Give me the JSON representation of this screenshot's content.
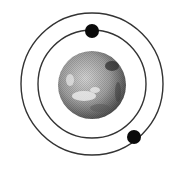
{
  "diagram": {
    "type": "planetary-system",
    "background": "#ffffff",
    "planet": {
      "cx": 92,
      "cy": 85,
      "r": 34,
      "fill": "#9a9a9a"
    },
    "orbits": [
      {
        "name": "inner-orbit",
        "cx": 92,
        "cy": 84,
        "r": 54,
        "stroke": "#333333"
      },
      {
        "name": "outer-orbit",
        "cx": 92,
        "cy": 84,
        "r": 71,
        "stroke": "#333333"
      }
    ],
    "satellites": [
      {
        "name": "satellite-top",
        "cx": 92,
        "cy": 31,
        "r": 7,
        "fill": "#0a0a0a"
      },
      {
        "name": "satellite-bottom-right",
        "cx": 134,
        "cy": 137,
        "r": 7,
        "fill": "#0a0a0a"
      }
    ]
  }
}
